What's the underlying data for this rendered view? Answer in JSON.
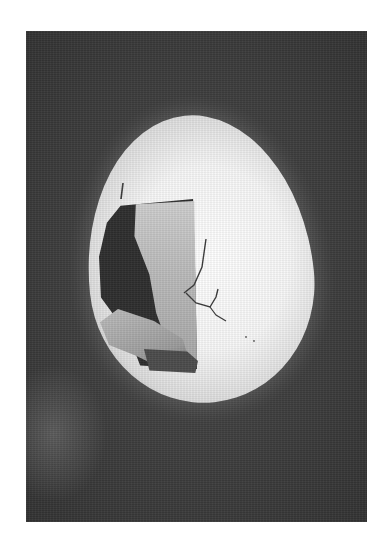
{
  "image": {
    "description": "Black-and-white photograph of a large cracked egg with a hole in its shell revealing a pale human figure curled inside, set against a dark grainy background",
    "subject": "figure inside a cracked egg",
    "colors": {
      "page_background": "#ffffff",
      "photo_background": "#3c3c3c",
      "egg_shell": "#f7f7f7",
      "hole_interior": "#2e2e2e",
      "figure": "#bdbdbd"
    }
  }
}
